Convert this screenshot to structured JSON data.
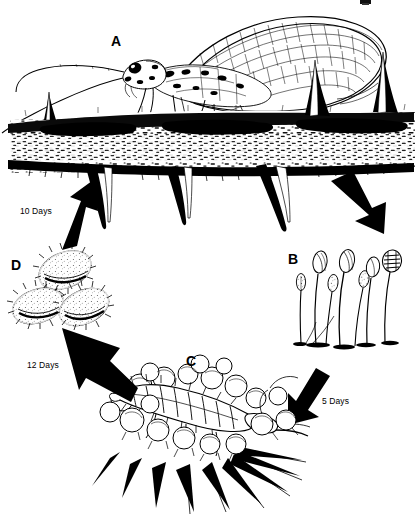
{
  "figure": {
    "background_color": "#ffffff",
    "ink_color": "#000000",
    "width": 417,
    "height": 523
  },
  "stages": [
    {
      "key": "A",
      "label": "A",
      "name": "adult-lacewing",
      "description": "Adult green lacewing resting on a leaf surface with long antennae and net-veined wings"
    },
    {
      "key": "B",
      "label": "B",
      "name": "stalked-eggs",
      "description": "Cluster of eggs on thin silken stalks, rightmost egg hatching"
    },
    {
      "key": "C",
      "label": "C",
      "name": "larva-feeding",
      "description": "Lacewing larva feeding among a colony of aphids on a plant"
    },
    {
      "key": "D",
      "label": "D",
      "name": "cocoons",
      "description": "Three round silken pupal cocoons"
    }
  ],
  "durations": [
    {
      "id": "d1",
      "label": "10 Days",
      "from": "D",
      "to": "A"
    },
    {
      "id": "d2",
      "label": "12 Days",
      "from": "C",
      "to": "D"
    },
    {
      "id": "d3",
      "label": "5 Days",
      "from": "B",
      "to": "C"
    }
  ],
  "arrows": [
    {
      "name": "arrow-d-to-a",
      "direction": "up-right"
    },
    {
      "name": "arrow-a-to-b",
      "direction": "down-right"
    },
    {
      "name": "arrow-b-to-c",
      "direction": "down-left"
    },
    {
      "name": "arrow-c-to-d",
      "direction": "up-left"
    }
  ]
}
